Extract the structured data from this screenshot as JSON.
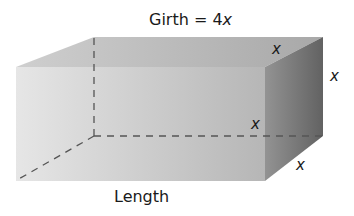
{
  "diagram": {
    "title": {
      "prefix": "Girth = 4",
      "variable": "x"
    },
    "labels": {
      "length": "Length",
      "top_depth": "x",
      "right_height": "x",
      "inner_height": "x",
      "bottom_depth": "x"
    },
    "shape": "rectangular-prism",
    "colors": {
      "front_light": "#e4e4e4",
      "front_dark": "#b9b9b9",
      "top_light": "#c8c8c8",
      "top_dark": "#a9a9a9",
      "side_light": "#8f8f8f",
      "side_dark": "#6a6a6a",
      "hidden_edge": "#555555",
      "text": "#1a1a1a"
    }
  }
}
